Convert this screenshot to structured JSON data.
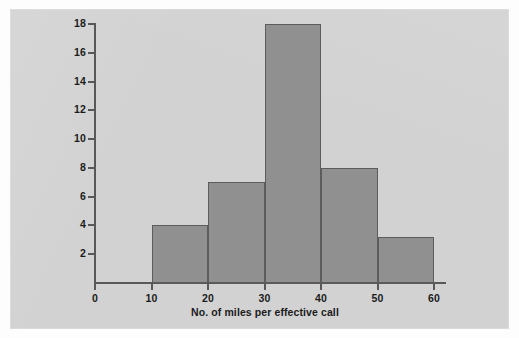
{
  "chart_data": {
    "type": "bar",
    "title": "",
    "subtitle": "",
    "xlabel": "No. of miles per effective call",
    "ylabel": "",
    "categories": [
      "10-20",
      "20-30",
      "30-40",
      "40-50",
      "50-60"
    ],
    "bin_edges": [
      10,
      20,
      30,
      40,
      50,
      60
    ],
    "values": [
      4,
      7,
      18,
      8,
      3.2
    ],
    "xlim": [
      0,
      60
    ],
    "ylim": [
      0,
      18
    ],
    "xticks": [
      0,
      10,
      20,
      30,
      40,
      50,
      60
    ],
    "yticks": [
      2,
      4,
      6,
      8,
      10,
      12,
      14,
      16,
      18
    ],
    "xtick_labels": [
      "0",
      "10",
      "20",
      "30",
      "40",
      "50",
      "60"
    ],
    "ytick_labels": [
      "2",
      "4",
      "6",
      "8",
      "10",
      "12",
      "14",
      "16",
      "18"
    ],
    "grid": false,
    "legend": null,
    "annotations": []
  },
  "style": {
    "panel_background": "#d5d5d5",
    "page_background": "#fdfdfd",
    "bar_fill": "#909090",
    "bar_stroke": "#5c5c5c",
    "axis_color": "#585858",
    "text_color": "#1b1b1b"
  }
}
